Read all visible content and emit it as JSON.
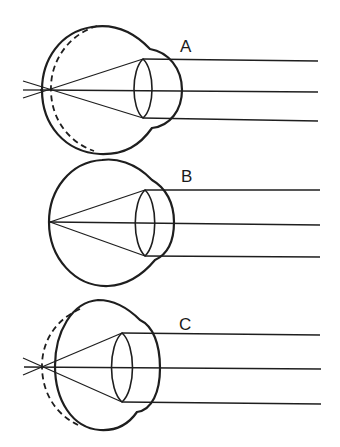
{
  "diagram": {
    "type": "eye refraction comparison",
    "panels": [
      {
        "id": "A",
        "label": "A",
        "condition": "focus falls behind retina (eyeball too short)"
      },
      {
        "id": "B",
        "label": "B",
        "condition": "normal eye, focus on retina"
      },
      {
        "id": "C",
        "label": "C",
        "condition": "focus falls behind retina (shortened eyeball)"
      }
    ],
    "colors": {
      "line": "#1e1e1e",
      "background": "#ffffff"
    }
  }
}
